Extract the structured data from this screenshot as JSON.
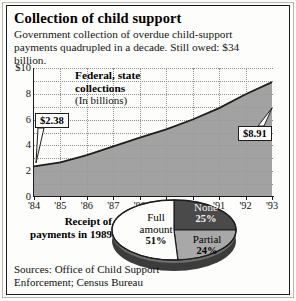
{
  "title": "Collection of child support",
  "subtitle": "Government collection of overdue child-support payments quadrupled in a decade. Still owed: $34 billion.",
  "legend": {
    "line1": "Federal, state",
    "line2": "collections",
    "line3": "(In billions)"
  },
  "callouts": {
    "start": "$2.38",
    "end": "$8.91"
  },
  "pie_caption": {
    "line1": "Receipt of",
    "line2": "payments in 1989"
  },
  "sources": {
    "line1": "Sources: Office of Child Support",
    "line2": "Enforcement; Census Bureau"
  },
  "colors": {
    "area_fill": "#9a9a9a",
    "area_line": "#1d1d1d",
    "pie_full": "#fdfdfb",
    "pie_none": "#4a4a4a",
    "pie_partial": "#a8a8a8",
    "grid": "#8e8e8e"
  },
  "chart_data": [
    {
      "type": "area",
      "title": "Federal, state collections",
      "ylabel": "(In billions)",
      "xlabel": "",
      "grid": true,
      "legend_position": "inside-top-left",
      "ylim": [
        0,
        10
      ],
      "yticks": [
        "$10",
        "8",
        "6",
        "4",
        "2",
        "0"
      ],
      "ytick_values": [
        10,
        8,
        6,
        4,
        2,
        0
      ],
      "categories": [
        "'84",
        "'85",
        "'86",
        "'87",
        "'88",
        "'89",
        "'90",
        "'91",
        "'92",
        "'93"
      ],
      "values": [
        2.38,
        2.69,
        3.25,
        3.92,
        4.6,
        5.24,
        6.01,
        6.89,
        7.96,
        8.91
      ],
      "annotations": [
        {
          "label": "$2.38",
          "x": "'84",
          "y": 2.38
        },
        {
          "label": "$8.91",
          "x": "'93",
          "y": 8.91
        }
      ]
    },
    {
      "type": "pie",
      "title": "Receipt of payments in 1989",
      "labels": [
        "Full amount",
        "None",
        "Partial"
      ],
      "values": [
        51,
        25,
        24
      ],
      "display_values": [
        "51%",
        "25%",
        "24%"
      ],
      "colors": [
        "#fdfdfb",
        "#4a4a4a",
        "#a8a8a8"
      ]
    }
  ]
}
